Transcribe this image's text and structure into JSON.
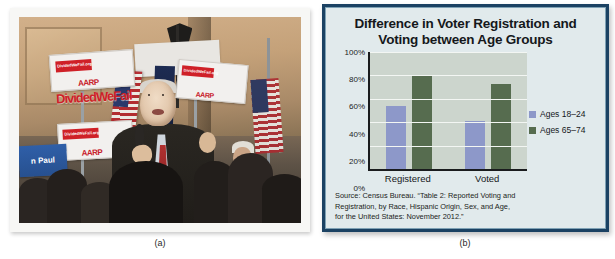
{
  "figure": {
    "caption_a": "(a)",
    "caption_b": "(b)"
  },
  "photo": {
    "alt_name": "political-rally-photo",
    "sign_brand": "AARP",
    "sign_url_text": "DividedWeFail.org",
    "big_sign_text": "DividedWeFail",
    "candidate_sign_text": "n Paul"
  },
  "chart_data": {
    "type": "bar",
    "title": "Difference in Voter Registration and Voting between Age Groups",
    "title_line1": "Difference in Voter Registration and",
    "title_line2": "Voting between Age Groups",
    "categories": [
      "Registered",
      "Voted"
    ],
    "series": [
      {
        "name": "Ages 18–24",
        "values": [
          54,
          41
        ],
        "color": "#8d98c9"
      },
      {
        "name": "Ages 65–74",
        "values": [
          80,
          73
        ],
        "color": "#566c4f"
      }
    ],
    "ylim": [
      0,
      100
    ],
    "yticks": [
      "100%",
      "80%",
      "60%",
      "40%",
      "20%",
      "0%"
    ],
    "ytick_values": [
      100,
      80,
      60,
      40,
      20,
      0
    ],
    "xlabel": "",
    "ylabel": "",
    "grid": true,
    "legend_position": "right",
    "source_line1": "Source: Census Bureau. “Table 2: Reported Voting and",
    "source_line2": "Registration, by Race, Hispanic Origin, Sex, and Age,",
    "source_line3": "for the United States: November 2012.”",
    "border_color": "#1b4263",
    "panel_color": "#e1eaec",
    "plot_color": "#ccd5cd"
  }
}
